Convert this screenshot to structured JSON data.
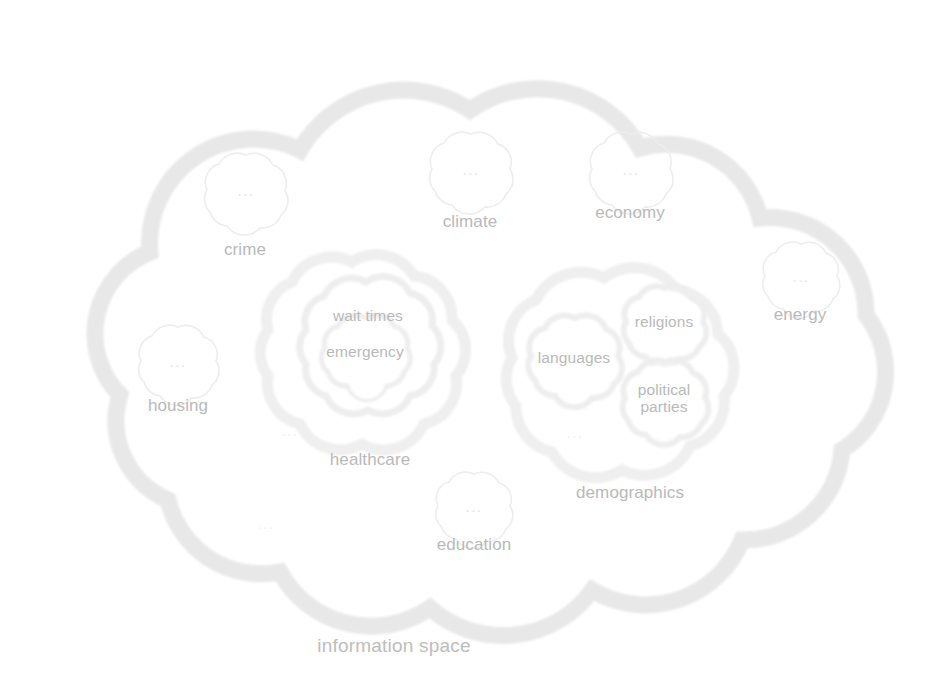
{
  "diagram": {
    "title": "information space",
    "caption": "information space",
    "caption_pos": {
      "x": 394,
      "y": 646
    },
    "colors": {
      "background": "#ffffff",
      "outer_band": "#e8e8e8",
      "cluster_band": "#efefef",
      "leaf_outline": "#ededed",
      "label_text": "#b9b9b9",
      "caption_text": "#bdbdbd",
      "ellipsis_text": "#e2e2e2"
    },
    "ellipsis_glyph": "...",
    "outer_cloud": {
      "name": "information space",
      "label": "information space"
    },
    "leaf_clouds": [
      {
        "label": "crime",
        "content": "...",
        "cx": 245,
        "cy": 189,
        "r": 47,
        "label_x": 245,
        "label_y": 250
      },
      {
        "label": "climate",
        "content": "...",
        "cx": 470,
        "cy": 168,
        "r": 46,
        "label_x": 470,
        "label_y": 222
      },
      {
        "label": "economy",
        "content": "...",
        "cx": 630,
        "cy": 168,
        "r": 46,
        "label_x": 630,
        "label_y": 213
      },
      {
        "label": "energy",
        "content": "...",
        "cx": 800,
        "cy": 275,
        "r": 42,
        "label_x": 800,
        "label_y": 315
      },
      {
        "label": "housing",
        "content": "...",
        "cx": 178,
        "cy": 360,
        "r": 44,
        "label_x": 178,
        "label_y": 406
      },
      {
        "label": "education",
        "content": "...",
        "cx": 474,
        "cy": 505,
        "r": 42,
        "label_x": 474,
        "label_y": 545
      }
    ],
    "clusters": [
      {
        "label": "healthcare",
        "cx": 360,
        "cy": 358,
        "r": 98,
        "label_x": 370,
        "label_y": 460,
        "children": [
          {
            "label": "wait times",
            "cx": 368,
            "cy": 340,
            "r": 66,
            "label_x": 368,
            "label_y": 316,
            "children": [
              {
                "label": "emergency",
                "cx": 365,
                "cy": 352,
                "r": 42,
                "label_x": 365,
                "label_y": 352
              }
            ]
          }
        ]
      },
      {
        "label": "demographics",
        "cx": 618,
        "cy": 370,
        "r": 110,
        "label_x": 630,
        "label_y": 493,
        "children": [
          {
            "label": "languages",
            "cx": 574,
            "cy": 358,
            "r": 47,
            "label_x": 574,
            "label_y": 358
          },
          {
            "label": "religions",
            "cx": 664,
            "cy": 322,
            "r": 42,
            "label_x": 664,
            "label_y": 322
          },
          {
            "label": "political\nparties",
            "cx": 664,
            "cy": 398,
            "r": 43,
            "label_x": 664,
            "label_y": 398
          }
        ]
      }
    ]
  }
}
